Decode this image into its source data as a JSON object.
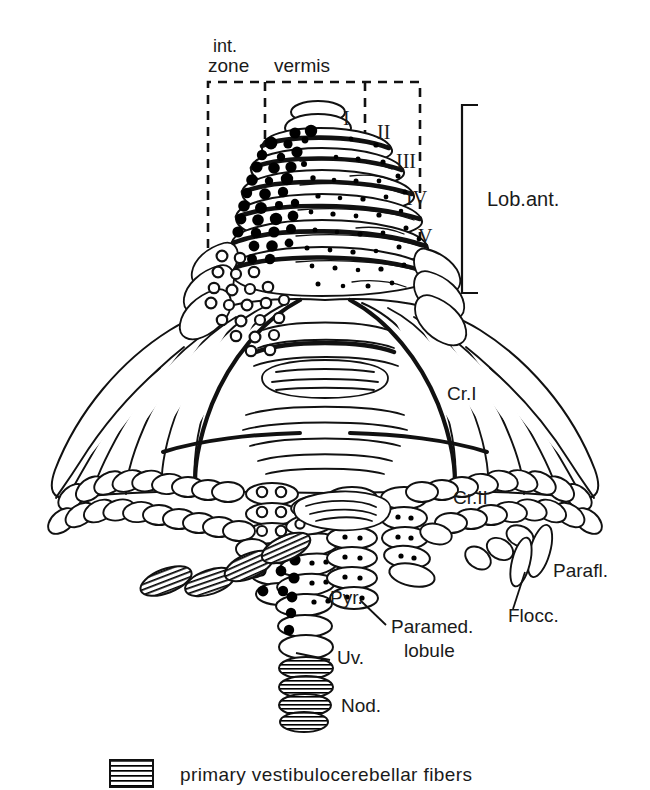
{
  "figure": {
    "background_color": "#ffffff",
    "ink_color": "#000000"
  },
  "zone_labels": {
    "int_line1": "int.",
    "int_line2": "zone",
    "vermis": "vermis"
  },
  "lobule_numerals": [
    {
      "label": "I",
      "x": 343,
      "y": 118
    },
    {
      "label": "II",
      "x": 381,
      "y": 131
    },
    {
      "label": "III",
      "x": 401,
      "y": 160
    },
    {
      "label": "IV",
      "x": 412,
      "y": 197
    },
    {
      "label": "V",
      "x": 422,
      "y": 235
    }
  ],
  "bracket_label": "Lob.ant.",
  "region_labels": [
    {
      "name": "crus-1",
      "label": "Cr.I",
      "x": 447,
      "y": 400
    },
    {
      "name": "crus-2",
      "label": "Cr.II",
      "x": 453,
      "y": 504
    },
    {
      "name": "paraflocculus",
      "label": "Parafl.",
      "x": 553,
      "y": 577
    },
    {
      "name": "flocculus",
      "label": "Flocc.",
      "x": 508,
      "y": 622
    },
    {
      "name": "pyramis",
      "label": "Pyr.",
      "x": 330,
      "y": 604
    },
    {
      "name": "paramedian-line1",
      "label": "Paramed.",
      "x": 391,
      "y": 633
    },
    {
      "name": "paramedian-line2",
      "label": "lobule",
      "x": 404,
      "y": 657
    },
    {
      "name": "uvula",
      "label": "Uv.",
      "x": 337,
      "y": 664
    },
    {
      "name": "nodulus",
      "label": "Nod.",
      "x": 341,
      "y": 712
    }
  ],
  "legend": {
    "swatch_name": "striped-swatch",
    "text": "primary vestibulocerebellar fibers"
  },
  "symbol_key": {
    "large_filled_dot": "dense projection (intermediate zone)",
    "small_filled_dot": "sparse projection (vermis)",
    "open_circle": "weak projection",
    "horizontal_stripes": "primary vestibulocerebellar fibers"
  },
  "dashed_box": {
    "x": 208,
    "y": 82,
    "width": 212,
    "height": 230,
    "divider_left_x": 265,
    "divider_right_x": 365
  }
}
